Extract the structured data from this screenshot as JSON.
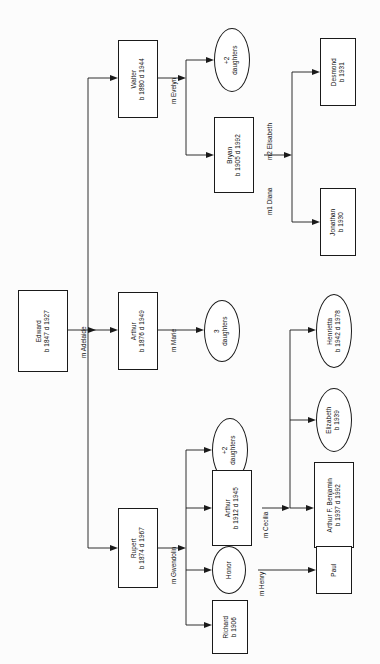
{
  "diagram": {
    "type": "family-tree",
    "orientation": "rotated-90-left",
    "root": "Edward"
  },
  "nodes": {
    "edward": {
      "name": "Edward",
      "dates": "b 1847 d 1927"
    },
    "walter": {
      "name": "Walter",
      "dates": "b 1880 d 1944"
    },
    "arthur_sr": {
      "name": "Arthur",
      "dates": "b 1876 d 1949"
    },
    "rupert": {
      "name": "Rupert",
      "dates": "b 1874 d 1967"
    },
    "walter_daughters": {
      "name": "+2",
      "dates": "daughters"
    },
    "bryan": {
      "name": "Bryan",
      "dates": "b 1905 d 1992"
    },
    "desmond": {
      "name": "Desmond",
      "dates": "b 1931"
    },
    "jonathan": {
      "name": "Jonathan",
      "dates": "b 1930"
    },
    "arthur_daughters": {
      "name": "3",
      "dates": "daughters"
    },
    "rupert_daughters": {
      "name": "+2",
      "dates": "daughters"
    },
    "arthur_jr": {
      "name": "Arthur",
      "dates": "b 1912 d 1945"
    },
    "honor": {
      "name": "Honor",
      "dates": ""
    },
    "richard": {
      "name": "Richard",
      "dates": "b 1906"
    },
    "henrietta": {
      "name": "Henrietta",
      "dates": "b 1942 d 1978"
    },
    "elizabeth": {
      "name": "Elizabeth",
      "dates": "b 1939"
    },
    "arthur_benjamin": {
      "name": "Arthur F. Benjamin",
      "dates": "b 1937 d 1992"
    },
    "paul": {
      "name": "Paul",
      "dates": ""
    }
  },
  "marriages": {
    "edward_spouse": "m Adelaide",
    "walter_spouse": "m Evelyn",
    "arthur_sr_spouse": "m Marie",
    "rupert_spouse": "m Gwendolin",
    "bryan_spouse1": "m1 Diana",
    "bryan_spouse2": "m2 Elisabeth",
    "arthur_jr_spouse": "m Cecilia",
    "honor_spouse": "m Henry"
  },
  "style": {
    "line_color": "#1a1a1a",
    "box_fill": "#ffffff",
    "background": "#fcfcfc"
  }
}
